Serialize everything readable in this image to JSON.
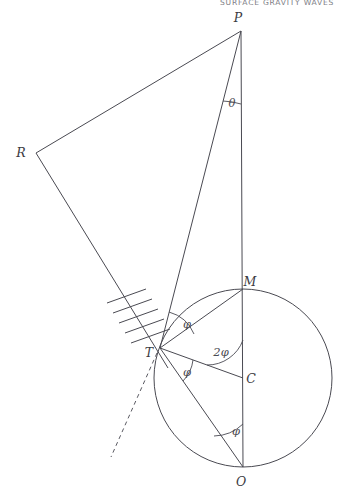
{
  "page": {
    "width": 344,
    "height": 494,
    "background": "#ffffff",
    "running_head": "SURFACE GRAVITY WAVES",
    "running_head_color": "#7d7d85"
  },
  "figure": {
    "type": "geometry-diagram",
    "stroke_color": "#4a4a52",
    "stroke_width": 1.0,
    "points": {
      "P": {
        "x": 241,
        "y": 31,
        "label": "P",
        "label_x": 238,
        "label_y": 22
      },
      "R": {
        "x": 36,
        "y": 153,
        "label": "R",
        "label_x": 21,
        "label_y": 157
      },
      "T": {
        "x": 160,
        "y": 348,
        "label": "T",
        "label_x": 149,
        "label_y": 357
      },
      "M": {
        "x": 243,
        "y": 289,
        "label": "M",
        "label_x": 247,
        "label_y": 286
      },
      "C": {
        "x": 243,
        "y": 378,
        "label": "C",
        "label_x": 248,
        "label_y": 382
      },
      "O": {
        "x": 243,
        "y": 467,
        "label": "O",
        "label_x": 239,
        "label_y": 484
      }
    },
    "circle": {
      "cx": 243,
      "cy": 378,
      "r": 89
    },
    "segments": [
      {
        "name": "P-R",
        "from": "P",
        "to": "R",
        "style": "solid"
      },
      {
        "name": "R-T-extended",
        "from": "R",
        "to": "T",
        "style": "solid"
      },
      {
        "name": "P-T",
        "from": "P",
        "to": "T",
        "style": "solid"
      },
      {
        "name": "P-O-vertical",
        "from": "P",
        "to": "O",
        "style": "solid"
      },
      {
        "name": "T-M",
        "from": "T",
        "to": "M",
        "style": "solid"
      },
      {
        "name": "T-C-radius",
        "from": "T",
        "to": "C",
        "style": "solid"
      },
      {
        "name": "T-O",
        "from": "T",
        "to": "O",
        "style": "solid"
      },
      {
        "name": "tangent-ray",
        "from": "T",
        "to": "dashed-end",
        "style": "dashed"
      }
    ],
    "dashed_ray_end": {
      "x": 111,
      "y": 457
    },
    "hatching": {
      "marks": 5,
      "along": "R-T",
      "side": "upper-left"
    },
    "angles": [
      {
        "name": "theta-at-P",
        "label": "θ",
        "vertex": "P",
        "label_x": 229,
        "label_y": 104
      },
      {
        "name": "phi-at-T-upper",
        "label": "φ",
        "vertex": "T",
        "label_x": 184,
        "label_y": 326
      },
      {
        "name": "phi-at-T-lower",
        "label": "φ",
        "vertex": "T",
        "label_x": 184,
        "label_y": 375
      },
      {
        "name": "two-phi-at-C",
        "label": "2φ",
        "vertex": "C",
        "label_x": 215,
        "label_y": 354
      },
      {
        "name": "phi-at-O",
        "label": "φ",
        "vertex": "O",
        "label_x": 232,
        "label_y": 433
      }
    ]
  }
}
